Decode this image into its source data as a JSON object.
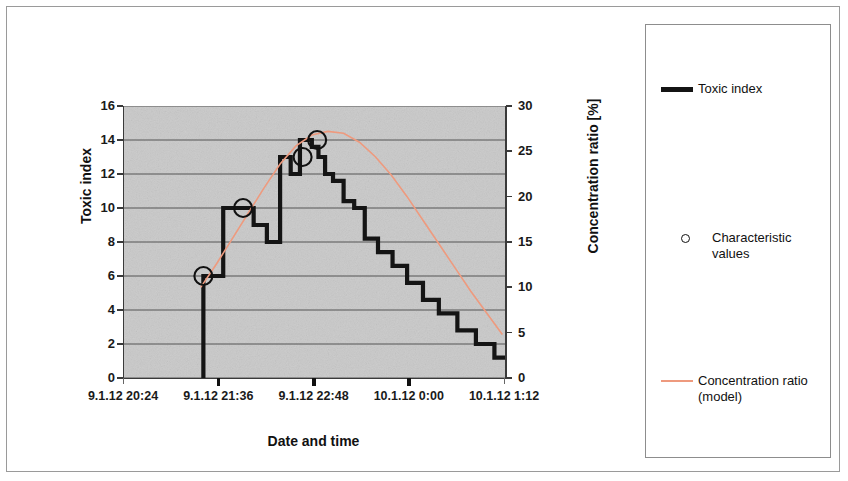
{
  "chart_data": {
    "type": "line",
    "title": "",
    "xlabel": "Date and time",
    "ylabel": "Toxic index",
    "y2label": "Concentration ratio [%]",
    "grid": true,
    "legend_position": "right",
    "xlim": [
      "9.1.12 20:24",
      "10.1.12 1:12"
    ],
    "x_tick_labels": [
      "9.1.12 20:24",
      "9.1.12 21:36",
      "9.1.12 22:48",
      "10.1.12 0:00",
      "10.1.12 1:12"
    ],
    "ylim": [
      0,
      16
    ],
    "y_tick_labels": [
      "0",
      "2",
      "4",
      "6",
      "8",
      "10",
      "12",
      "14",
      "16"
    ],
    "y2lim": [
      0,
      30
    ],
    "y2_tick_labels": [
      "0",
      "5",
      "10",
      "15",
      "20",
      "25",
      "30"
    ],
    "series": [
      {
        "name": "Toxic index",
        "type": "step",
        "color": "#141414",
        "axis": "left",
        "x_minutes": [
          60,
          60,
          75,
          75,
          90,
          90,
          98,
          98,
          108,
          108,
          118,
          118,
          126,
          126,
          133,
          133,
          138,
          138,
          142,
          142,
          147,
          147,
          152,
          152,
          158,
          158,
          166,
          166,
          174,
          174,
          182,
          182,
          192,
          192,
          203,
          203,
          214,
          214,
          226,
          226,
          238,
          238,
          252,
          252,
          266,
          266,
          280,
          280,
          292,
          292
        ],
        "values": [
          0,
          6,
          6,
          10,
          10,
          10,
          10,
          9,
          9,
          8,
          8,
          13,
          13,
          12,
          12,
          14,
          14,
          14,
          14,
          13.6,
          13.6,
          13,
          13,
          12,
          12,
          11.6,
          11.6,
          10.4,
          10.4,
          10,
          10,
          8.2,
          8.2,
          7.4,
          7.4,
          6.6,
          6.6,
          5.6,
          5.6,
          4.6,
          4.6,
          3.8,
          3.8,
          2.8,
          2.8,
          2,
          2,
          1.2,
          1.2,
          0
        ]
      },
      {
        "name": "Concentration ratio (model)",
        "type": "line",
        "color": "#ee9a7e",
        "axis": "right",
        "x_minutes": [
          58,
          70,
          82,
          94,
          106,
          118,
          130,
          142,
          154,
          166,
          178,
          190,
          202,
          214,
          226,
          238,
          250,
          262,
          274,
          286
        ],
        "values": [
          10.0,
          12.6,
          15.4,
          18.2,
          21.0,
          23.6,
          25.6,
          26.8,
          27.2,
          27.0,
          26.0,
          24.4,
          22.4,
          20.0,
          17.4,
          14.8,
          12.2,
          9.6,
          7.2,
          4.8
        ]
      },
      {
        "name": "Characteristic values",
        "type": "scatter",
        "marker": "open-circle",
        "color": "#111111",
        "axis": "left",
        "x_minutes": [
          60,
          90,
          135,
          146
        ],
        "values": [
          6,
          10,
          13,
          14
        ]
      }
    ]
  },
  "legend": {
    "entries": [
      {
        "label": "Toxic index",
        "icon": "thick-line-swatch",
        "color": "#141414"
      },
      {
        "label": "Characteristic values",
        "icon": "open-circle-swatch",
        "color": "#111111"
      },
      {
        "label": "Concentration ratio\n(model)",
        "icon": "thin-line-swatch",
        "color": "#ee9a7e"
      }
    ]
  },
  "axes": {
    "left_title": "Toxic index",
    "right_title": "Concentration ratio [%]",
    "bottom_title": "Date and time",
    "left_ticks": [
      "16",
      "14",
      "12",
      "10",
      "8",
      "6",
      "4",
      "2",
      "0"
    ],
    "right_ticks": [
      "30",
      "25",
      "20",
      "15",
      "10",
      "5",
      "0"
    ],
    "bottom_ticks": [
      "9.1.12 20:24",
      "9.1.12 21:36",
      "9.1.12 22:48",
      "10.1.12 0:00",
      "10.1.12 1:12"
    ]
  }
}
